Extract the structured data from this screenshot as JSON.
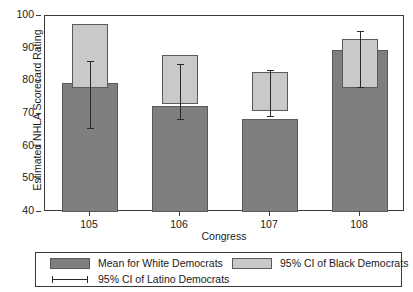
{
  "chart_data": {
    "type": "bar",
    "title": "",
    "xlabel": "Congress",
    "ylabel": "Estimated NHLA Scorecard Rating",
    "categories": [
      "105",
      "106",
      "107",
      "108"
    ],
    "ylim": [
      40,
      100
    ],
    "yticks": [
      40,
      50,
      60,
      70,
      80,
      90,
      100
    ],
    "grid": false,
    "legend_position": "bottom",
    "series": [
      {
        "name": "Mean for White Democrats",
        "kind": "bar",
        "color": "#7f7f7f",
        "values": [
          79.5,
          72.5,
          68.5,
          89.5
        ]
      },
      {
        "name": "95% CI of Black Democrats",
        "kind": "interval-box",
        "color": "#c9c9c9",
        "lower": [
          78.0,
          73.0,
          71.0,
          78.0
        ],
        "upper": [
          97.5,
          88.0,
          83.0,
          93.0
        ]
      },
      {
        "name": "95% CI of Latino Democrats",
        "kind": "errorbar",
        "color": "#2a2a2a",
        "lower": [
          65.5,
          68.2,
          69.0,
          78.0
        ],
        "upper": [
          86.3,
          85.3,
          83.5,
          95.3
        ]
      }
    ]
  },
  "axes": {
    "ylabel": "Estimated NHLA Scorecard Rating",
    "xlabel": "Congress",
    "ytick_labels": [
      "100",
      "90",
      "80",
      "70",
      "60",
      "50",
      "40"
    ],
    "xtick_labels": [
      "105",
      "106",
      "107",
      "108"
    ]
  },
  "legend": {
    "items": [
      {
        "label": "Mean for White Democrats",
        "swatch": "solid-dark-gray"
      },
      {
        "label": "95% CI of Black Democrats",
        "swatch": "solid-light-gray"
      },
      {
        "label": "95% CI of Latino Democrats",
        "swatch": "error-bar-line"
      }
    ]
  },
  "colors": {
    "white_democrats": "#7f7f7f",
    "black_democrats": "#c9c9c9",
    "latino_democrats": "#2a2a2a",
    "axis": "#3a3a3a",
    "background": "#ffffff"
  }
}
